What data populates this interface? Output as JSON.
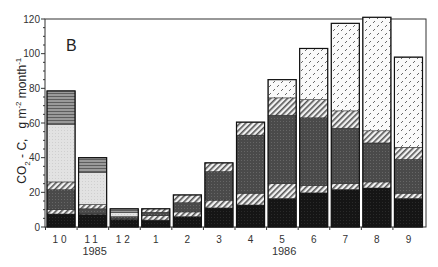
{
  "chart_data": {
    "type": "bar",
    "stacked": true,
    "panel_label": "B",
    "title": "",
    "xlabel": "",
    "ylabel": "CO2 - C, g m-2 month-1",
    "ylim": [
      0,
      120
    ],
    "yticks": [
      0,
      20,
      40,
      60,
      80,
      100,
      120
    ],
    "grid": false,
    "categories": [
      "10",
      "11",
      "12",
      "1",
      "2",
      "3",
      "4",
      "5",
      "6",
      "7",
      "8",
      "9"
    ],
    "year_labels": [
      {
        "label": "1985",
        "under_category": "11"
      },
      {
        "label": "1986",
        "under_category": "5"
      }
    ],
    "series": [
      {
        "name": "black (bottom)",
        "pattern": "solid-black",
        "values": [
          7.5,
          7,
          4.5,
          4,
          6,
          11,
          12.7,
          16.5,
          19.7,
          21.7,
          22.5,
          16.5
        ]
      },
      {
        "name": "diagonal hatch (lower)",
        "pattern": "hatch",
        "values": [
          2.5,
          0.5,
          0.5,
          2.5,
          2.7,
          4.5,
          6.8,
          8.5,
          4.3,
          3.3,
          3.5,
          3
        ]
      },
      {
        "name": "dark gray",
        "pattern": "dark-gray",
        "values": [
          11.5,
          3,
          1,
          2,
          5.3,
          16.5,
          33.5,
          39.5,
          39,
          32,
          22.5,
          19.5
        ]
      },
      {
        "name": "diagonal hatch (upper)",
        "pattern": "hatch",
        "values": [
          4.5,
          2.5,
          0,
          2,
          4.5,
          5,
          7.5,
          10,
          10.5,
          10,
          7,
          7
        ]
      },
      {
        "name": "light gray stipple",
        "pattern": "light-gray",
        "values": [
          33,
          18.5,
          2.5,
          0,
          0,
          0,
          0,
          0,
          0,
          0,
          0,
          0
        ]
      },
      {
        "name": "horizontal stripes",
        "pattern": "h-stripes",
        "values": [
          19.5,
          8.5,
          2,
          0,
          0,
          0,
          0,
          0,
          0,
          0,
          0,
          0
        ]
      },
      {
        "name": "dotted/dash pattern (top)",
        "pattern": "dashes",
        "values": [
          0,
          0,
          0,
          0,
          0,
          0,
          0,
          10.5,
          29.5,
          50.5,
          65.5,
          52
        ]
      }
    ],
    "totals": [
      78.5,
      41.5,
      10.5,
      10.5,
      18.5,
      37,
      60.5,
      85,
      103,
      117.5,
      121,
      98
    ]
  }
}
